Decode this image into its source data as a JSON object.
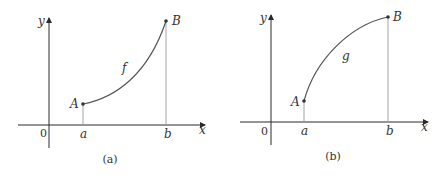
{
  "panels": [
    {
      "caption": "(a)",
      "function_label": "f",
      "point_start": "A",
      "point_end": "B",
      "origin_label": "0",
      "x_start_label": "a",
      "x_end_label": "b",
      "x_axis_label": "x",
      "y_axis_label": "y",
      "curve_shape": "concave up, increasing"
    },
    {
      "caption": "(b)",
      "function_label": "g",
      "point_start": "A",
      "point_end": "B",
      "origin_label": "0",
      "x_start_label": "a",
      "x_end_label": "b",
      "x_axis_label": "x",
      "y_axis_label": "y",
      "curve_shape": "concave down, increasing"
    }
  ]
}
